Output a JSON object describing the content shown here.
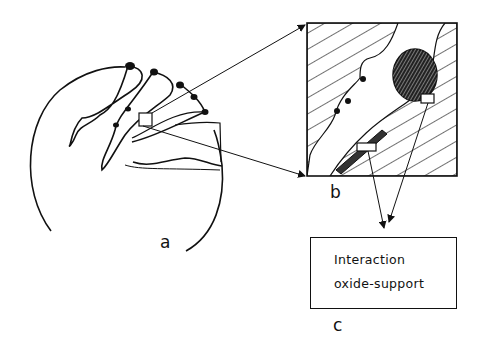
{
  "panels": {
    "a": {
      "label": "a",
      "description": "catalyst grain cross-section with pores and particles"
    },
    "b": {
      "label": "b",
      "description": "magnified pore region showing oxide particle and support"
    },
    "c": {
      "label": "c",
      "box_lines": [
        "Interaction",
        "oxide-support"
      ]
    }
  },
  "colors": {
    "ink": "#111111",
    "background": "#ffffff"
  }
}
